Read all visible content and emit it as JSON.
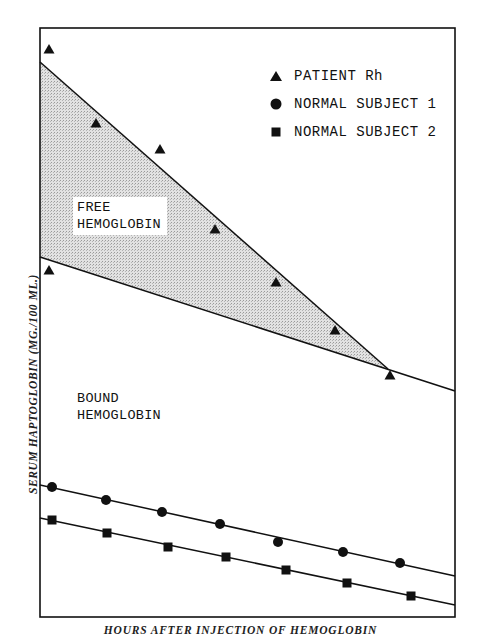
{
  "header": {
    "truncated_caption": ""
  },
  "chart_data": {
    "type": "scatter",
    "title": "",
    "xlabel": "HOURS AFTER INJECTION OF HEMOGLOBIN",
    "ylabel": "SERUM HAPTOGLOBIN (MG./100 ML.)",
    "grid": false,
    "axis_ticks": "none",
    "legend_position": "upper right",
    "legend": [
      {
        "marker": "triangle",
        "label": "PATIENT Rh"
      },
      {
        "marker": "circle",
        "label": "NORMAL SUBJECT 1"
      },
      {
        "marker": "square",
        "label": "NORMAL SUBJECT 2"
      }
    ],
    "annotations": [
      {
        "text_lines": [
          "FREE",
          "HEMOGLOBIN"
        ],
        "region": "shaded area between upper and lower patient lines"
      },
      {
        "text_lines": [
          "BOUND",
          "HEMOGLOBIN"
        ],
        "region": "below lower patient line"
      }
    ],
    "pixel_frame": {
      "left": 40,
      "top": 28,
      "right": 455,
      "bottom": 617
    },
    "series": [
      {
        "name": "PATIENT Rh",
        "marker": "triangle",
        "points_px": [
          [
            49,
            49
          ],
          [
            96,
            123
          ],
          [
            160,
            149
          ],
          [
            215,
            229
          ],
          [
            276,
            282
          ],
          [
            335,
            330
          ],
          [
            390,
            375
          ],
          [
            49,
            270
          ]
        ]
      },
      {
        "name": "NORMAL SUBJECT 1",
        "marker": "circle",
        "points_px": [
          [
            52,
            487
          ],
          [
            106,
            500
          ],
          [
            162,
            512
          ],
          [
            220,
            524
          ],
          [
            278,
            542
          ],
          [
            343,
            552
          ],
          [
            400,
            563
          ]
        ]
      },
      {
        "name": "NORMAL SUBJECT 2",
        "marker": "square",
        "points_px": [
          [
            52,
            520
          ],
          [
            107,
            533
          ],
          [
            168,
            547
          ],
          [
            226,
            557
          ],
          [
            286,
            570
          ],
          [
            347,
            583
          ],
          [
            411,
            596
          ]
        ]
      }
    ],
    "lines_px": [
      {
        "name": "patient-total",
        "from": [
          40,
          62
        ],
        "to": [
          388,
          369
        ]
      },
      {
        "name": "patient-bound",
        "from": [
          40,
          257
        ],
        "to": [
          455,
          391
        ]
      },
      {
        "name": "normal-1-fit",
        "from": [
          40,
          485
        ],
        "to": [
          455,
          576
        ]
      },
      {
        "name": "normal-2-fit",
        "from": [
          40,
          518
        ],
        "to": [
          455,
          605
        ]
      }
    ],
    "shaded_region": {
      "name": "free-hemoglobin",
      "polygon_px": [
        [
          40,
          62
        ],
        [
          388,
          369
        ],
        [
          40,
          257
        ]
      ],
      "fill": "#d9d9d9"
    }
  },
  "labels": {
    "free_line1": "FREE",
    "free_line2": "HEMOGLOBIN",
    "bound_line1": "BOUND",
    "bound_line2": "HEMOGLOBIN"
  },
  "colors": {
    "ink": "#111111",
    "shade": "#d9d9d9",
    "background": "#ffffff"
  }
}
